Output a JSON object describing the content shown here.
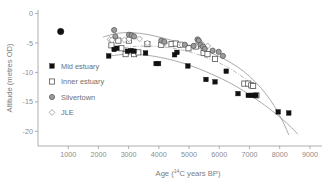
{
  "chart_data": {
    "type": "scatter",
    "title": "",
    "xlabel": "Age (14C years BP)",
    "xlabel_parts": {
      "prefix": "Age (",
      "superscript": "14",
      "suffix": "C years BP)"
    },
    "ylabel": "Altitude (metres OD)",
    "xlim": [
      0,
      9400
    ],
    "ylim": [
      -22.5,
      0.6
    ],
    "xticks": [
      1000,
      2000,
      3000,
      4000,
      5000,
      6000,
      7000,
      8000,
      9000
    ],
    "xtick_labels": [
      "1000",
      "2000",
      "3000",
      "4000",
      "5000",
      "6000",
      "7000",
      "8000",
      "9000"
    ],
    "yticks": [
      0,
      -5,
      -10,
      -15,
      -20
    ],
    "ytick_labels": [
      "0",
      "-5",
      "-10",
      "-15",
      "-20"
    ],
    "grid": false,
    "legend_position": "inside-left",
    "series": [
      {
        "name": "Mid estuary",
        "marker": "filled-square",
        "color": "#111111",
        "points": [
          [
            2340,
            -7.2
          ],
          [
            2520,
            -6.1
          ],
          [
            2610,
            -5.9
          ],
          [
            2960,
            -6.4
          ],
          [
            3080,
            -6.3
          ],
          [
            3180,
            -6.4
          ],
          [
            3560,
            -6.7
          ],
          [
            3910,
            -8.5
          ],
          [
            3990,
            -8.5
          ],
          [
            4520,
            -7.0
          ],
          [
            4600,
            -6.6
          ],
          [
            4960,
            -8.9
          ],
          [
            5560,
            -11.2
          ],
          [
            5860,
            -11.6
          ],
          [
            6230,
            -9.8
          ],
          [
            6620,
            -13.6
          ],
          [
            6960,
            -13.9
          ],
          [
            7060,
            -13.9
          ],
          [
            7150,
            -13.9
          ],
          [
            7210,
            -13.9
          ],
          [
            7950,
            -16.7
          ],
          [
            8300,
            -16.9
          ]
        ]
      },
      {
        "name": "Inner estuary",
        "marker": "open-square",
        "color": "#ffffff",
        "points": [
          [
            2430,
            -5.4
          ],
          [
            2660,
            -4.6
          ],
          [
            2760,
            -5.9
          ],
          [
            2900,
            -6.9
          ],
          [
            3010,
            -4.6
          ],
          [
            3180,
            -6.9
          ],
          [
            3320,
            -6.6
          ],
          [
            3620,
            -5.2
          ],
          [
            4080,
            -5.3
          ],
          [
            4420,
            -5.2
          ],
          [
            4560,
            -5.1
          ],
          [
            4710,
            -5.3
          ],
          [
            4980,
            -5.9
          ],
          [
            5220,
            -5.6
          ],
          [
            5480,
            -6.7
          ],
          [
            5610,
            -6.9
          ],
          [
            5860,
            -7.7
          ],
          [
            6830,
            -11.9
          ],
          [
            6960,
            -11.9
          ],
          [
            7060,
            -12.2
          ],
          [
            7120,
            -12.3
          ],
          [
            7230,
            -13.9
          ]
        ]
      },
      {
        "name": "Silvertown",
        "marker": "filled-circle-gray",
        "color": "#9d9d9d",
        "points": [
          [
            2520,
            -2.8
          ],
          [
            2560,
            -3.9
          ],
          [
            3010,
            -3.6
          ],
          [
            3100,
            -3.7
          ],
          [
            3180,
            -3.9
          ],
          [
            4080,
            -4.6
          ],
          [
            4180,
            -4.8
          ],
          [
            4860,
            -5.3
          ],
          [
            5150,
            -5.5
          ],
          [
            5280,
            -4.4
          ],
          [
            5320,
            -4.6
          ],
          [
            5380,
            -5.3
          ],
          [
            5460,
            -5.6
          ],
          [
            5520,
            -6.0
          ],
          [
            5780,
            -6.3
          ],
          [
            5980,
            -6.5
          ],
          [
            6120,
            -7.2
          ]
        ]
      },
      {
        "name": "JLE",
        "marker": "open-diamond",
        "color": "#ffffff",
        "points": [
          [
            2380,
            -4.4
          ],
          [
            2450,
            -4.5
          ],
          [
            2860,
            -4.5
          ],
          [
            3010,
            -4.3
          ],
          [
            3360,
            -4.3
          ],
          [
            3620,
            -5.0
          ],
          [
            4200,
            -5.0
          ],
          [
            4760,
            -5.3
          ],
          [
            5320,
            -4.9
          ],
          [
            5420,
            -5.1
          ],
          [
            5620,
            -5.5
          ]
        ]
      }
    ],
    "trend_lines": [
      {
        "name": "upper-bound-curve",
        "style": "solid",
        "points": [
          [
            2150,
            -4.0
          ],
          [
            2600,
            -3.3
          ],
          [
            3100,
            -3.2
          ],
          [
            3600,
            -3.5
          ],
          [
            4100,
            -4.1
          ],
          [
            4600,
            -4.8
          ],
          [
            5100,
            -5.5
          ],
          [
            5600,
            -6.4
          ],
          [
            6100,
            -7.5
          ],
          [
            6600,
            -9.0
          ],
          [
            7000,
            -10.6
          ],
          [
            7400,
            -12.7
          ],
          [
            7700,
            -14.7
          ],
          [
            7950,
            -16.8
          ],
          [
            8150,
            -18.8
          ],
          [
            8300,
            -20.6
          ]
        ]
      },
      {
        "name": "mid-trend-curve",
        "style": "dash-dot",
        "points": [
          [
            2600,
            -6.0
          ],
          [
            3100,
            -5.6
          ],
          [
            3600,
            -5.5
          ],
          [
            4100,
            -5.6
          ],
          [
            4600,
            -6.0
          ],
          [
            5100,
            -6.6
          ],
          [
            5600,
            -7.5
          ],
          [
            6100,
            -8.6
          ],
          [
            6500,
            -9.8
          ],
          [
            6900,
            -11.2
          ],
          [
            7200,
            -12.4
          ]
        ]
      },
      {
        "name": "lower-bound-curve",
        "style": "solid",
        "points": [
          [
            2280,
            -7.3
          ],
          [
            2800,
            -6.9
          ],
          [
            3300,
            -6.9
          ],
          [
            3800,
            -7.2
          ],
          [
            4300,
            -7.7
          ],
          [
            4800,
            -8.4
          ],
          [
            5300,
            -9.3
          ],
          [
            5800,
            -10.4
          ],
          [
            6300,
            -11.6
          ],
          [
            6800,
            -13.1
          ],
          [
            7300,
            -14.8
          ],
          [
            7700,
            -16.3
          ],
          [
            8100,
            -18.0
          ],
          [
            8400,
            -19.4
          ],
          [
            8600,
            -20.5
          ]
        ]
      }
    ],
    "outlier_point": {
      "name": "isolated-mid-estuary-point",
      "x": 750,
      "y": -3.05,
      "marker": "filled-circle"
    }
  },
  "legend": {
    "items": [
      {
        "label": "Mid estuary",
        "marker": "filled-square"
      },
      {
        "label": "Inner estuary",
        "marker": "open-square"
      },
      {
        "label": "Silvertown",
        "marker": "filled-circle-gray"
      },
      {
        "label": "JLE",
        "marker": "open-diamond"
      }
    ]
  },
  "colors": {
    "axis": "#9a9a9a",
    "tick_text": "#8c8c8c",
    "title_text": "#7d7d7d",
    "mid_estuary": "#111111",
    "silvertown": "#9d9d9d",
    "trend": "#8e8e8e"
  }
}
